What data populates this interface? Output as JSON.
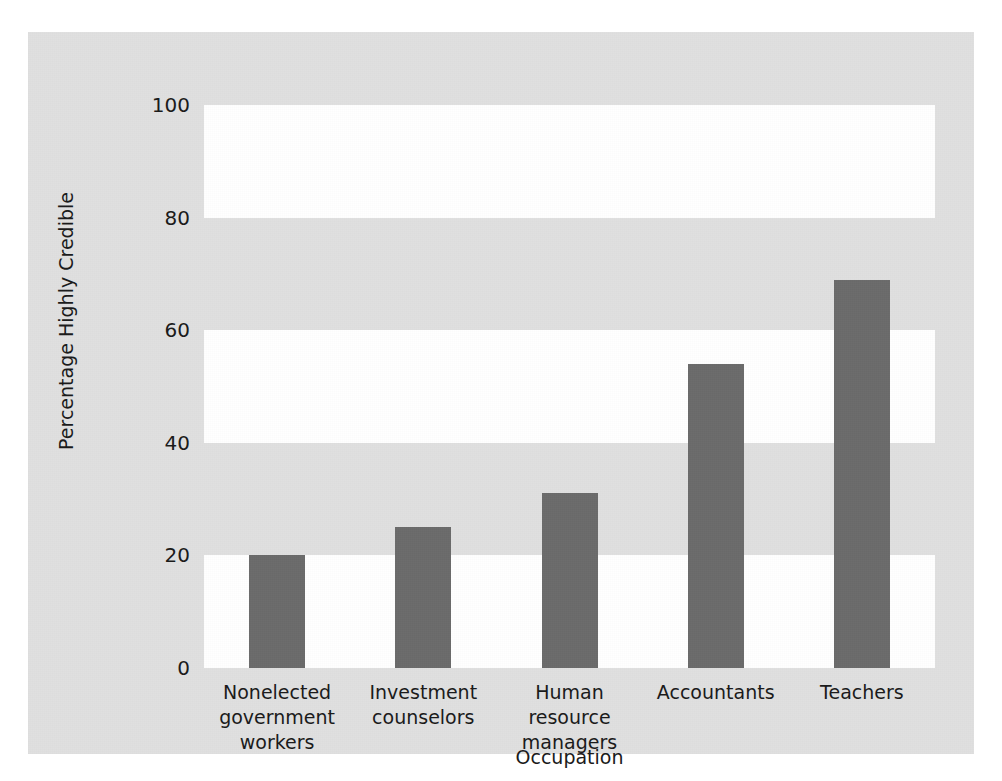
{
  "chart_data": {
    "type": "bar",
    "title": "",
    "subtitle": "",
    "xlabel": "Occupation",
    "ylabel": "Percentage Highly Credible",
    "categories": [
      "Nonelected government workers",
      "Investment counselors",
      "Human resource managers",
      "Accountants",
      "Teachers"
    ],
    "category_lines": [
      [
        "Nonelected",
        "government workers"
      ],
      [
        "Investment",
        "counselors"
      ],
      [
        "Human resource",
        "managers"
      ],
      [
        "Accountants",
        ""
      ],
      [
        "Teachers",
        ""
      ]
    ],
    "values": [
      20,
      25,
      31,
      54,
      69
    ],
    "ylim": [
      0,
      100
    ],
    "yticks": [
      0,
      20,
      40,
      60,
      80,
      100
    ],
    "ytick_labels": [
      "0",
      "20",
      "40",
      "60",
      "80",
      "100"
    ],
    "grid": false,
    "banded_background": true,
    "legend": "none",
    "bar_color": "#6b6b6b",
    "plot_band_white": "#ffffff",
    "plot_band_gray": "#e0e0e0",
    "figure_background": "#e0e0e0",
    "text_color": "#1a1a1a"
  },
  "axes": {
    "y_axis_title": "Percentage Highly Credible",
    "x_axis_title": "Occupation"
  }
}
